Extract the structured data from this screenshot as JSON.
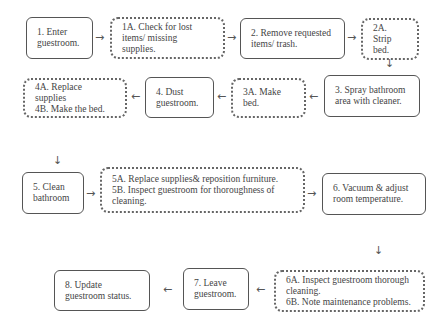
{
  "diagram": {
    "type": "flowchart",
    "nodes": [
      {
        "id": "1",
        "style": "solid",
        "text": "1. Enter\nguestroom."
      },
      {
        "id": "1A",
        "style": "dotted",
        "text": "1A. Check for lost\nitems/ missing supplies."
      },
      {
        "id": "2",
        "style": "solid",
        "text": "2. Remove requested\nitems/ trash."
      },
      {
        "id": "2A",
        "style": "dotted",
        "text": "2A. Strip\nbed."
      },
      {
        "id": "3",
        "style": "solid",
        "text": "3. Spray bathroom\narea with cleaner."
      },
      {
        "id": "3A",
        "style": "dotted",
        "text": "3A. Make\nbed."
      },
      {
        "id": "4",
        "style": "solid",
        "text": "4. Dust\nguestroom."
      },
      {
        "id": "4A",
        "style": "dotted",
        "text": "4A. Replace supplies\n4B. Make the bed."
      },
      {
        "id": "5",
        "style": "solid",
        "text": "5. Clean\nbathroom"
      },
      {
        "id": "5A",
        "style": "dotted",
        "text": "5A. Replace supplies& reposition furniture.\n5B. Inspect guestroom for thoroughness of\ncleaning."
      },
      {
        "id": "6",
        "style": "solid",
        "text": "6. Vacuum & adjust\nroom temperature."
      },
      {
        "id": "6A",
        "style": "dotted",
        "text": "6A. Inspect guestroom thorough\ncleaning.\n6B. Note maintenance problems."
      },
      {
        "id": "7",
        "style": "solid",
        "text": "7. Leave\nguestroom."
      },
      {
        "id": "8",
        "style": "solid",
        "text": "8. Update\nguestroom status."
      }
    ],
    "edges": [
      {
        "from": "1",
        "to": "1A",
        "glyph": "→"
      },
      {
        "from": "1A",
        "to": "2",
        "glyph": "→"
      },
      {
        "from": "2",
        "to": "2A",
        "glyph": "→"
      },
      {
        "from": "2A",
        "to": "3",
        "glyph": "↓"
      },
      {
        "from": "3",
        "to": "3A",
        "glyph": "←"
      },
      {
        "from": "3A",
        "to": "4",
        "glyph": "←"
      },
      {
        "from": "4",
        "to": "4A",
        "glyph": "←"
      },
      {
        "from": "4A",
        "to": "5",
        "glyph": "↓"
      },
      {
        "from": "5",
        "to": "5A",
        "glyph": "→"
      },
      {
        "from": "5A",
        "to": "6",
        "glyph": "→"
      },
      {
        "from": "6",
        "to": "6A",
        "glyph": "↓"
      },
      {
        "from": "6A",
        "to": "7",
        "glyph": "←"
      },
      {
        "from": "7",
        "to": "8",
        "glyph": "←"
      }
    ]
  }
}
